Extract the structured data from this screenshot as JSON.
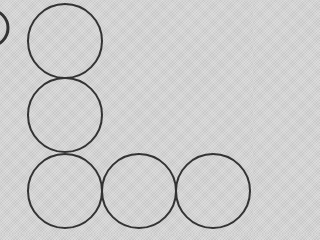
{
  "figure": {
    "width": 253,
    "height": 234,
    "background_color": "#d4d4d4",
    "stroke_color": "#333333",
    "stroke_width": 2,
    "radius": 37,
    "circles": [
      {
        "id": "column-top",
        "cx": 65,
        "cy": 41
      },
      {
        "id": "column-middle",
        "cx": 65,
        "cy": 115
      },
      {
        "id": "corner",
        "cx": 65,
        "cy": 191
      },
      {
        "id": "row-middle",
        "cx": 139,
        "cy": 191
      },
      {
        "id": "row-right",
        "cx": 213,
        "cy": 191
      }
    ],
    "partial_arc": {
      "id": "left-edge-fragment",
      "cx": -10,
      "cy": 28,
      "r": 18
    }
  }
}
